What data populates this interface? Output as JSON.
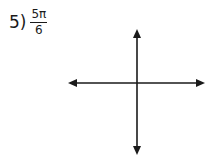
{
  "problem": {
    "number_label": "5)",
    "fraction": {
      "numerator": "5π",
      "denominator": "6"
    }
  },
  "axes": {
    "color": "#1a1a1a",
    "horizontal": {
      "x1": 68,
      "x2": 205,
      "y": 83
    },
    "vertical": {
      "x": 137,
      "y1": 29,
      "y2": 155
    }
  }
}
